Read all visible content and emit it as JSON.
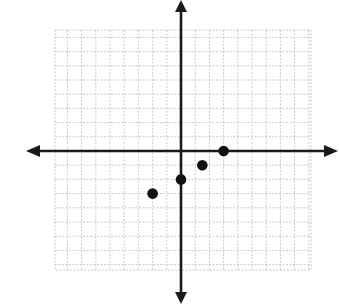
{
  "chart_data": {
    "type": "scatter",
    "title": "",
    "xlabel": "",
    "ylabel": "",
    "grid": true,
    "axes_with_arrows": true,
    "tick_labels": false,
    "xlim": [
      -9,
      9
    ],
    "ylim": [
      -8.5,
      8.5
    ],
    "points": [
      {
        "x": 3,
        "y": 0
      },
      {
        "x": 1.5,
        "y": -1
      },
      {
        "x": 0,
        "y": -2
      },
      {
        "x": -2,
        "y": -3
      }
    ],
    "colors": {
      "axis": "#1a1a1a",
      "grid": "#bdbdbd",
      "point": "#111111",
      "background": "#ffffff"
    }
  },
  "layout": {
    "origin_px": [
      181,
      151
    ],
    "unit_px": 14.2,
    "grid_box": {
      "left": 55,
      "top": 30,
      "right": 311,
      "bottom": 270
    }
  }
}
